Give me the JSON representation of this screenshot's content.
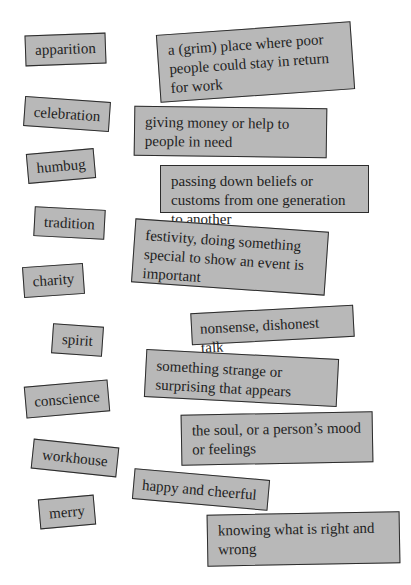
{
  "worksheet": {
    "words": [
      {
        "id": "apparition",
        "label": "apparition"
      },
      {
        "id": "celebration",
        "label": "celebration"
      },
      {
        "id": "humbug",
        "label": "humbug"
      },
      {
        "id": "tradition",
        "label": "tradition"
      },
      {
        "id": "charity",
        "label": "charity"
      },
      {
        "id": "spirit",
        "label": "spirit"
      },
      {
        "id": "conscience",
        "label": "conscience"
      },
      {
        "id": "workhouse",
        "label": "workhouse"
      },
      {
        "id": "merry",
        "label": "merry"
      }
    ],
    "definitions": [
      {
        "text": "a (grim) place where poor people could stay in return for work"
      },
      {
        "text": "giving money or help to people in need"
      },
      {
        "text": "passing down beliefs or customs from one generation to another"
      },
      {
        "text": "festivity, doing something special to show an event is important"
      },
      {
        "text": "nonsense, dishonest talk"
      },
      {
        "text": "something strange or surprising that appears"
      },
      {
        "text": "the soul, or a person’s mood or feelings"
      },
      {
        "text": "happy and cheerful"
      },
      {
        "text": "knowing what is right and wrong"
      }
    ]
  },
  "colors": {
    "card_fill": "#b8b8b8",
    "card_border": "#2c2c2c",
    "text": "#1e1e1e",
    "background": "#ffffff"
  }
}
